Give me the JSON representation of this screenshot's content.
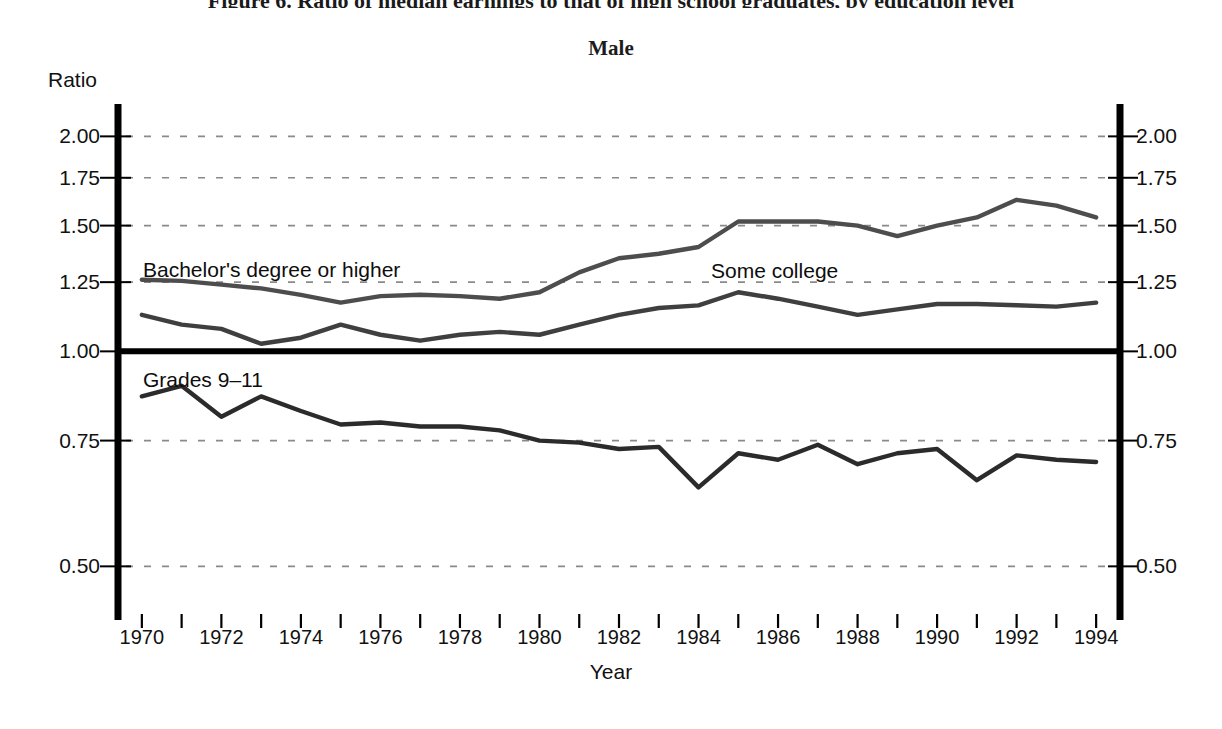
{
  "figure": {
    "title": "Figure 6. Ratio of median earnings to that of high school graduates, by education level",
    "panel_title": "Male",
    "y_axis_name": "Ratio",
    "x_axis_name": "Year"
  },
  "chart_data": {
    "type": "line",
    "title": "Male",
    "xlabel": "Year",
    "ylabel": "Ratio",
    "yscale": "log",
    "ylim": [
      0.44,
      2.22
    ],
    "xlim": [
      1969.4,
      1994.6
    ],
    "grid": true,
    "grid_style": "dashed-horizontal",
    "legend_position": "inline-annotations",
    "ytick_labels": [
      "2.00",
      "1.75",
      "1.50",
      "1.25",
      "1.00",
      "0.75",
      "0.50"
    ],
    "ytick_values": [
      2.0,
      1.75,
      1.5,
      1.25,
      1.0,
      0.75,
      0.5
    ],
    "xtick_labels": [
      "1970",
      "1972",
      "1974",
      "1976",
      "1978",
      "1980",
      "1982",
      "1984",
      "1986",
      "1988",
      "1990",
      "1992",
      "1994"
    ],
    "xtick_values": [
      1970,
      1972,
      1974,
      1976,
      1978,
      1980,
      1982,
      1984,
      1986,
      1988,
      1990,
      1992,
      1994
    ],
    "minor_xticks": [
      1970,
      1971,
      1972,
      1973,
      1974,
      1975,
      1976,
      1977,
      1978,
      1979,
      1980,
      1981,
      1982,
      1983,
      1984,
      1985,
      1986,
      1987,
      1988,
      1989,
      1990,
      1991,
      1992,
      1993,
      1994
    ],
    "x": [
      1970,
      1971,
      1972,
      1973,
      1974,
      1975,
      1976,
      1977,
      1978,
      1979,
      1980,
      1981,
      1982,
      1983,
      1984,
      1985,
      1986,
      1987,
      1988,
      1989,
      1990,
      1991,
      1992,
      1993,
      1994
    ],
    "reference_line": {
      "value": 1.0,
      "label": "High school graduate",
      "style": "solid-thick"
    },
    "series": [
      {
        "name": "Bachelor's degree or higher",
        "label_text": "Bachelor's degree or higher",
        "color": "#4d4d4d",
        "values": [
          1.26,
          1.255,
          1.24,
          1.225,
          1.2,
          1.17,
          1.195,
          1.2,
          1.195,
          1.185,
          1.21,
          1.29,
          1.35,
          1.37,
          1.4,
          1.52,
          1.52,
          1.52,
          1.5,
          1.45,
          1.5,
          1.54,
          1.63,
          1.6,
          1.54
        ]
      },
      {
        "name": "Some college",
        "label_text": "Some college",
        "color": "#3f3f3f",
        "values": [
          1.125,
          1.09,
          1.075,
          1.025,
          1.045,
          1.09,
          1.055,
          1.035,
          1.055,
          1.065,
          1.055,
          1.09,
          1.125,
          1.15,
          1.16,
          1.21,
          1.185,
          1.155,
          1.125,
          1.145,
          1.165,
          1.165,
          1.16,
          1.155,
          1.17
        ]
      },
      {
        "name": "Grades 9-11",
        "label_text": "Grades 9–11",
        "color": "#2b2b2b",
        "values": [
          0.865,
          0.895,
          0.81,
          0.865,
          0.825,
          0.79,
          0.795,
          0.785,
          0.785,
          0.775,
          0.75,
          0.745,
          0.73,
          0.735,
          0.645,
          0.72,
          0.705,
          0.74,
          0.695,
          0.72,
          0.73,
          0.66,
          0.715,
          0.705,
          0.7
        ]
      }
    ]
  },
  "annotations": [
    {
      "name": "bachelors-label",
      "text": "Bachelor's degree or higher",
      "x_px": 143,
      "y_px": 258
    },
    {
      "name": "some-college-label",
      "text": "Some college",
      "x_px": 711,
      "y_px": 259
    },
    {
      "name": "grades-label",
      "text": "Grades 9–11",
      "x_px": 143,
      "y_px": 368
    }
  ],
  "colors": {
    "axis": "#000000",
    "grid": "#8a8a8a",
    "series_bachelors": "#4d4d4d",
    "series_some_college": "#3f3f3f",
    "series_grades": "#2b2b2b",
    "background": "#ffffff"
  }
}
